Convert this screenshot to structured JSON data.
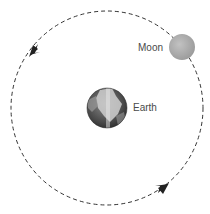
{
  "diagram": {
    "type": "orbit",
    "labels": {
      "moon": "Moon",
      "earth": "Earth"
    },
    "orbit": {
      "style": "dashed",
      "direction": "counterclockwise",
      "arrows": 2
    },
    "colors": {
      "orbit_line": "#333333",
      "moon_fill": "#a8a8a8",
      "earth_dark": "#3a3a3a",
      "earth_light": "#d0d0d0",
      "label_text": "#4a4a4a",
      "background": "#ffffff"
    },
    "bodies": [
      {
        "name": "Earth",
        "position": "center"
      },
      {
        "name": "Moon",
        "position": "upper-right on orbit"
      }
    ]
  }
}
